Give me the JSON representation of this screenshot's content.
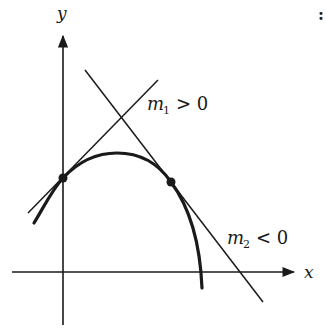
{
  "figure": {
    "axes": {
      "x_label": "x",
      "y_label": "y"
    },
    "tangent_lines": [
      {
        "name": "m",
        "subscript": "1",
        "relation": "> 0",
        "meaning": "positive slope"
      },
      {
        "name": "m",
        "subscript": "2",
        "relation": "< 0",
        "meaning": "negative slope"
      }
    ],
    "corner_mark": ":",
    "colors": {
      "ink": "#1a1a1a",
      "background": "#ffffff"
    }
  }
}
